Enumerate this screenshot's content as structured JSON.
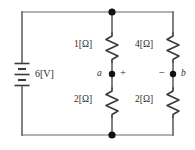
{
  "figure": {
    "type": "electrical-circuit-schematic",
    "background_color": "#ffffff",
    "wire_color": "#9a9a9a",
    "element_color": "#3a3a3a",
    "node_dot_color": "#1a1a1a",
    "text_color": "#2b2b2b"
  },
  "source": {
    "name": "battery",
    "label": "6[V]",
    "value": 6,
    "unit": "V",
    "symbol": "battery-cell-stack"
  },
  "resistors": [
    {
      "id": "r-top-left",
      "label": "1[Ω]",
      "value": 1,
      "unit": "Ω",
      "branch": "left",
      "position": "top"
    },
    {
      "id": "r-top-right",
      "label": "4[Ω]",
      "value": 4,
      "unit": "Ω",
      "branch": "right",
      "position": "top"
    },
    {
      "id": "r-bottom-left",
      "label": "2[Ω]",
      "value": 2,
      "unit": "Ω",
      "branch": "left",
      "position": "bottom"
    },
    {
      "id": "r-bottom-right",
      "label": "2[Ω]",
      "value": 2,
      "unit": "Ω",
      "branch": "right",
      "position": "bottom"
    }
  ],
  "terminals": [
    {
      "id": "terminal-a",
      "label": "a",
      "polarity": "+",
      "polarity_side": "right",
      "label_side": "left"
    },
    {
      "id": "terminal-b",
      "label": "b",
      "polarity": "−",
      "polarity_side": "left",
      "label_side": "right"
    }
  ],
  "junctions": [
    {
      "id": "junction-top",
      "label": ""
    },
    {
      "id": "junction-bottom",
      "label": ""
    }
  ]
}
